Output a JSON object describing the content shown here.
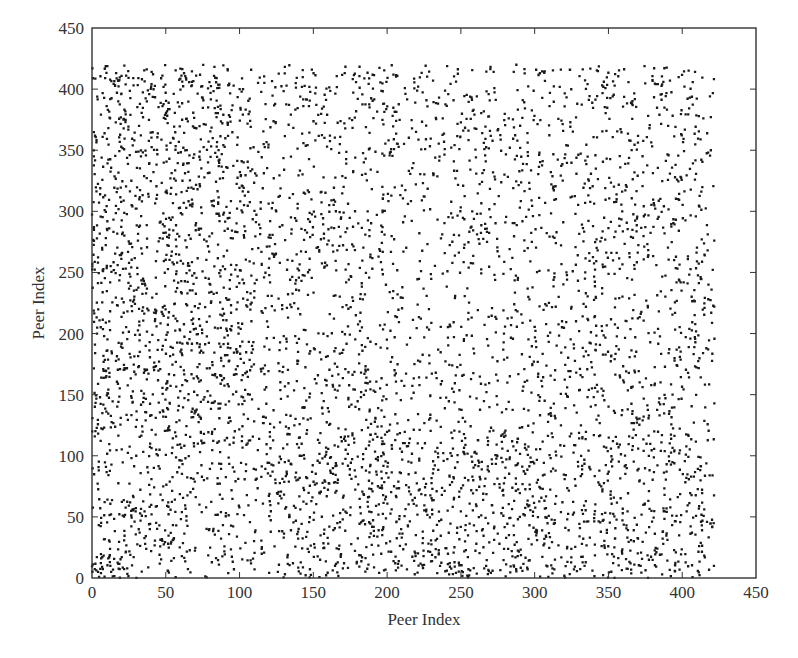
{
  "chart_data": {
    "type": "scatter",
    "title": "",
    "xlabel": "Peer Index",
    "ylabel": "Peer Index",
    "xlim": [
      0,
      450
    ],
    "ylim": [
      0,
      450
    ],
    "xticks": [
      0,
      50,
      100,
      150,
      200,
      250,
      300,
      350,
      400,
      450
    ],
    "yticks": [
      0,
      50,
      100,
      150,
      200,
      250,
      300,
      350,
      400,
      450
    ],
    "grid": false,
    "legend": null,
    "marker": {
      "color": "#1a1a1a",
      "size": 2.3
    },
    "data_extent": {
      "x": [
        0,
        422
      ],
      "y": [
        0,
        420
      ]
    },
    "density_regions": [
      {
        "x": [
          0,
          22
        ],
        "y": [
          0,
          20
        ],
        "weight": 6.0
      },
      {
        "x": [
          20,
          65
        ],
        "y": [
          15,
          65
        ],
        "weight": 2.2
      },
      {
        "x": [
          0,
          110
        ],
        "y": [
          100,
          420
        ],
        "weight": 1.6
      },
      {
        "x": [
          110,
          422
        ],
        "y": [
          0,
          120
        ],
        "weight": 1.5
      },
      {
        "x": [
          110,
          422
        ],
        "y": [
          120,
          420
        ],
        "weight": 1.0
      },
      {
        "x": [
          190,
          300
        ],
        "y": [
          170,
          280
        ],
        "weight": 0.75
      },
      {
        "x": [
          0,
          110
        ],
        "y": [
          0,
          100
        ],
        "weight": 1.0
      }
    ],
    "point_count_estimate": 12000
  },
  "axes": {
    "x_title": "Peer Index",
    "y_title": "Peer Index"
  }
}
